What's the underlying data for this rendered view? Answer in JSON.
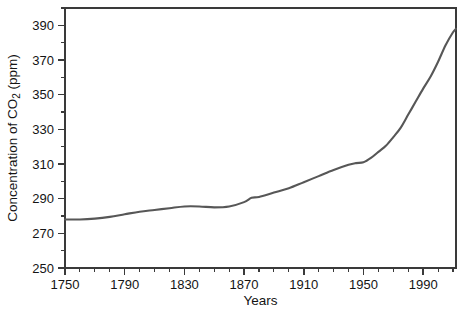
{
  "chart_data": {
    "type": "line",
    "title": "",
    "xlabel": "Years",
    "ylabel": "Concentration of CO2 (ppm)",
    "ylabel_parts": {
      "prefix": "Concentration of CO",
      "subscript": "2",
      "suffix": " (ppm)"
    },
    "xlim": [
      1750,
      2012
    ],
    "ylim": [
      250,
      400
    ],
    "x_major_ticks": [
      1750,
      1790,
      1830,
      1870,
      1910,
      1950,
      1990
    ],
    "x_major_tick_labels": [
      "1750",
      "1790",
      "1830",
      "1870",
      "1910",
      "1950",
      "1990"
    ],
    "x_minor_tick_step": 10,
    "y_major_ticks": [
      250,
      270,
      290,
      310,
      330,
      350,
      370,
      390
    ],
    "y_major_tick_labels": [
      "250",
      "270",
      "290",
      "310",
      "330",
      "350",
      "370",
      "390"
    ],
    "y_minor_tick_step": 10,
    "grid": false,
    "legend": "none",
    "series": [
      {
        "name": "Atmospheric CO2 concentration",
        "color": "#575757",
        "x": [
          1750,
          1760,
          1770,
          1780,
          1790,
          1800,
          1810,
          1820,
          1830,
          1840,
          1850,
          1860,
          1870,
          1875,
          1880,
          1890,
          1900,
          1910,
          1920,
          1930,
          1940,
          1945,
          1950,
          1955,
          1960,
          1965,
          1970,
          1975,
          1980,
          1985,
          1990,
          1995,
          2000,
          2005,
          2010,
          2012
        ],
        "y": [
          278,
          278,
          278.5,
          279.5,
          281,
          282.5,
          283.5,
          284.5,
          285.5,
          285.5,
          285,
          285.5,
          288,
          290.5,
          291,
          293.5,
          296,
          299.5,
          303,
          306.5,
          309.5,
          310.5,
          311,
          313.5,
          317,
          320.5,
          325.5,
          331,
          338.5,
          346,
          353.5,
          360.5,
          369,
          378.5,
          386,
          388
        ]
      }
    ]
  },
  "axis_style": {
    "line_color": "#3a3a3a",
    "tick_color": "#3a3a3a",
    "background": "#ffffff"
  },
  "plot_geometry": {
    "left": 65,
    "top": 8,
    "right": 456,
    "bottom": 268
  }
}
